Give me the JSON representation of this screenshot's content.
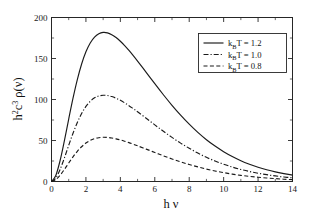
{
  "chart_data": {
    "type": "line",
    "title": "",
    "xlabel": "h ν",
    "ylabel": "h²c³ρ(ν)",
    "xlim": [
      0,
      14
    ],
    "ylim": [
      0,
      200
    ],
    "xticks": [
      0,
      2,
      4,
      6,
      8,
      10,
      12,
      14
    ],
    "xticklabels": [
      "0",
      "2",
      "4",
      "6",
      "8",
      "10",
      "12",
      "14"
    ],
    "xminor": [
      1,
      3,
      5,
      7,
      9,
      11,
      13
    ],
    "yticks": [
      0,
      50,
      100,
      150,
      200
    ],
    "yticklabels": [
      "0",
      "50",
      "100",
      "150",
      "200"
    ],
    "yminor": [
      25,
      75,
      125,
      175
    ],
    "grid": false,
    "legend_position": "upper right",
    "series": [
      {
        "name": "k_BT = 1.2",
        "label_main": "T = 1.2",
        "label_prefix": "k",
        "label_sub": "B",
        "style": "solid",
        "temperature": 1.2,
        "peak_x": 3.39,
        "peak_y": 193,
        "x": [
          0.0,
          0.25,
          0.5,
          0.75,
          1.0,
          1.25,
          1.5,
          1.75,
          2.0,
          2.25,
          2.5,
          2.75,
          3.0,
          3.25,
          3.5,
          3.75,
          4.0,
          4.25,
          4.5,
          4.75,
          5.0,
          5.5,
          6.0,
          6.5,
          7.0,
          7.5,
          8.0,
          8.5,
          9.0,
          9.5,
          10.0,
          10.5,
          11.0,
          11.5,
          12.0,
          12.5,
          13.0,
          13.5,
          14.0
        ],
        "y": [
          0.0,
          7.3,
          25.6,
          49.9,
          76.2,
          101.6,
          124.3,
          143.3,
          158.2,
          169.0,
          176.2,
          180.3,
          181.8,
          181.3,
          179.1,
          175.6,
          171.0,
          165.7,
          159.8,
          153.5,
          146.9,
          133.2,
          119.3,
          105.8,
          92.9,
          80.9,
          69.9,
          59.9,
          51.0,
          43.2,
          36.4,
          30.5,
          25.4,
          21.1,
          17.4,
          14.3,
          11.7,
          9.6,
          7.8
        ]
      },
      {
        "name": "k_BT = 1.0",
        "label_main": "T = 1.0",
        "label_prefix": "k",
        "label_sub": "B",
        "style": "dashdot",
        "temperature": 1.0,
        "peak_x": 2.82,
        "peak_y": 112,
        "x": [
          0.0,
          0.25,
          0.5,
          0.75,
          1.0,
          1.25,
          1.5,
          1.75,
          2.0,
          2.25,
          2.5,
          2.75,
          3.0,
          3.25,
          3.5,
          3.75,
          4.0,
          4.25,
          4.5,
          4.75,
          5.0,
          5.5,
          6.0,
          6.5,
          7.0,
          7.5,
          8.0,
          8.5,
          9.0,
          9.5,
          10.0,
          10.5,
          11.0,
          11.5,
          12.0,
          12.5,
          13.0,
          13.5,
          14.0
        ],
        "y": [
          0.0,
          4.2,
          14.8,
          28.8,
          44.1,
          58.8,
          71.9,
          82.9,
          91.6,
          97.8,
          102.0,
          104.3,
          105.2,
          104.9,
          103.6,
          101.6,
          99.0,
          95.9,
          92.5,
          88.8,
          85.0,
          77.1,
          69.1,
          61.2,
          53.8,
          46.8,
          40.5,
          34.7,
          29.5,
          25.0,
          21.1,
          17.6,
          14.7,
          12.2,
          10.1,
          8.3,
          6.8,
          5.5,
          4.5
        ]
      },
      {
        "name": "k_BT = 0.8",
        "label_main": "T = 0.8",
        "label_prefix": "k",
        "label_sub": "B",
        "style": "dashed",
        "temperature": 0.8,
        "peak_x": 2.26,
        "peak_y": 57.5,
        "x": [
          0.0,
          0.25,
          0.5,
          0.75,
          1.0,
          1.25,
          1.5,
          1.75,
          2.0,
          2.25,
          2.5,
          2.75,
          3.0,
          3.25,
          3.5,
          3.75,
          4.0,
          4.25,
          4.5,
          4.75,
          5.0,
          5.5,
          6.0,
          6.5,
          7.0,
          7.5,
          8.0,
          8.5,
          9.0,
          9.5,
          10.0,
          10.5,
          11.0,
          11.5,
          12.0,
          12.5,
          13.0,
          13.5,
          14.0
        ],
        "y": [
          0.0,
          2.2,
          7.6,
          14.7,
          22.6,
          30.1,
          36.8,
          42.4,
          46.9,
          50.1,
          52.2,
          53.4,
          53.9,
          53.7,
          53.1,
          52.0,
          50.7,
          49.1,
          47.4,
          45.5,
          43.5,
          39.5,
          35.4,
          31.3,
          27.5,
          24.0,
          20.7,
          17.8,
          15.1,
          12.8,
          10.8,
          9.0,
          7.5,
          6.2,
          5.2,
          4.3,
          3.5,
          2.8,
          2.3
        ]
      }
    ]
  }
}
